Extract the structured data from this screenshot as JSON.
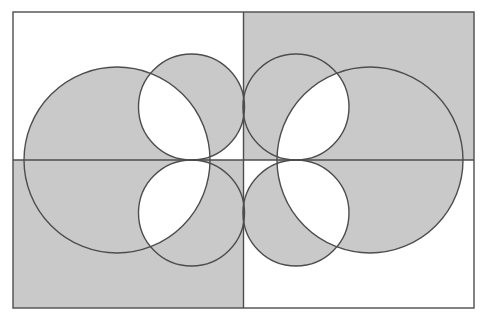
{
  "figure": {
    "title": "Overlapping circles XOR shading diagram",
    "canvas": {
      "width": 490,
      "height": 321,
      "background": "#ffffff"
    },
    "frame": {
      "label": "rectangle-border",
      "x": 13,
      "y": 12,
      "width": 461,
      "height": 296,
      "stroke": "#4d4d4d",
      "stroke_width": 1.4,
      "fill": "none"
    },
    "divider_cross": {
      "label": "quadrant-divider-cross",
      "center_x": 243.5,
      "center_y": 160,
      "vertical_line": {
        "x1": 243.5,
        "y1": 12,
        "x2": 243.5,
        "y2": 308
      },
      "horizontal_line": {
        "x1": 13,
        "y1": 160,
        "x2": 474,
        "y2": 160
      },
      "stroke": "#4d4d4d",
      "stroke_width": 1.4
    },
    "quadrants": [
      {
        "name": "top-left",
        "x": 13,
        "y": 12,
        "width": 230.5,
        "height": 148,
        "shaded": false
      },
      {
        "name": "top-right",
        "x": 243.5,
        "y": 12,
        "width": 230.5,
        "height": 148,
        "shaded": true
      },
      {
        "name": "bottom-left",
        "x": 13,
        "y": 160,
        "width": 230.5,
        "height": 148,
        "shaded": true
      },
      {
        "name": "bottom-right",
        "x": 243.5,
        "y": 160,
        "width": 230.5,
        "height": 148,
        "shaded": false
      }
    ],
    "circles": [
      {
        "name": "large-left-circle",
        "cx": 117,
        "cy": 160,
        "r": 93
      },
      {
        "name": "large-right-circle",
        "cx": 370,
        "cy": 160,
        "r": 93
      },
      {
        "name": "medium-top-left-circle",
        "cx": 191.5,
        "cy": 107,
        "r": 53
      },
      {
        "name": "medium-top-right-circle",
        "cx": 296,
        "cy": 107,
        "r": 53
      },
      {
        "name": "medium-bottom-left-circle",
        "cx": 191.5,
        "cy": 213,
        "r": 53
      },
      {
        "name": "medium-bottom-right-circle",
        "cx": 296,
        "cy": 213,
        "r": 53
      }
    ],
    "colors": {
      "shade_fill": "#c9c9c9",
      "unshaded_fill": "#ffffff",
      "outline": "#4d4d4d",
      "page_background": "#ffffff"
    },
    "shading_rule": "XOR parity: a region is shaded when covered by an odd number of shapes (shaded quadrants plus circles)."
  }
}
